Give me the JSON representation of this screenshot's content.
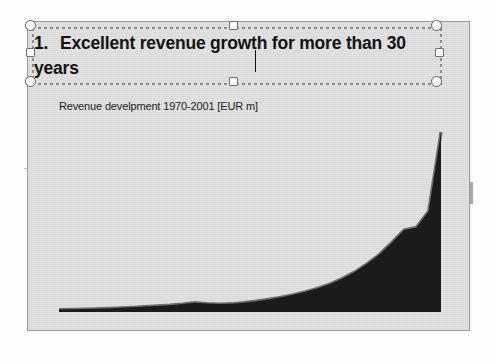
{
  "app": {
    "name": "presentation-slide-editor",
    "background_color": "#fdfdfd",
    "slide_background_color": "#d9d9d9",
    "slide_border_color": "#9a9a9a"
  },
  "slide": {
    "title": {
      "number": "1.",
      "text": "Excellent revenue growth for more than 30 years",
      "line1": "Excellent revenue growth for more than",
      "line2": "30 years",
      "selected": true,
      "caret_visible": true
    },
    "subtitle": "Revenue develpment 1970-2001 [EUR m]"
  },
  "selection_handles": [
    {
      "name": "handle-top-left",
      "shape": "circle",
      "x": 0,
      "y": 0
    },
    {
      "name": "handle-top-center",
      "shape": "square",
      "x": 203,
      "y": 0
    },
    {
      "name": "handle-top-right",
      "shape": "circle",
      "x": 406,
      "y": 0
    },
    {
      "name": "handle-middle-left",
      "shape": "square",
      "x": 0,
      "y": 26
    },
    {
      "name": "handle-middle-right",
      "shape": "square",
      "x": 406,
      "y": 26
    },
    {
      "name": "handle-bottom-left",
      "shape": "circle",
      "x": 0,
      "y": 52
    },
    {
      "name": "handle-bottom-center",
      "shape": "square",
      "x": 203,
      "y": 52
    },
    {
      "name": "handle-bottom-right",
      "shape": "circle",
      "x": 406,
      "y": 52
    }
  ],
  "chart_data": {
    "type": "area",
    "title": "Revenue develpment 1970-2001 [EUR m]",
    "xlabel": "",
    "ylabel": "",
    "grid": false,
    "legend": false,
    "axis_visible": false,
    "fill_color": "#1b1b1b",
    "edge_color": "#6e6e6e",
    "xlim": [
      1970,
      2001
    ],
    "ylim": [
      0,
      1000
    ],
    "x": [
      1970,
      1971,
      1972,
      1973,
      1974,
      1975,
      1976,
      1977,
      1978,
      1979,
      1980,
      1981,
      1982,
      1983,
      1984,
      1985,
      1986,
      1987,
      1988,
      1989,
      1990,
      1991,
      1992,
      1993,
      1994,
      1995,
      1996,
      1997,
      1998,
      1999,
      2000,
      2001
    ],
    "values": [
      14,
      15,
      16,
      18,
      20,
      23,
      26,
      30,
      34,
      38,
      44,
      52,
      47,
      44,
      46,
      52,
      60,
      70,
      82,
      96,
      112,
      132,
      156,
      186,
      222,
      268,
      320,
      385,
      455,
      470,
      560,
      1000
    ],
    "categories": [
      "1970",
      "1971",
      "1972",
      "1973",
      "1974",
      "1975",
      "1976",
      "1977",
      "1978",
      "1979",
      "1980",
      "1981",
      "1982",
      "1983",
      "1984",
      "1985",
      "1986",
      "1987",
      "1988",
      "1989",
      "1990",
      "1991",
      "1992",
      "1993",
      "1994",
      "1995",
      "1996",
      "1997",
      "1998",
      "1999",
      "2000",
      "2001"
    ],
    "series": [
      {
        "name": "Revenue",
        "values": [
          14,
          15,
          16,
          18,
          20,
          23,
          26,
          30,
          34,
          38,
          44,
          52,
          47,
          44,
          46,
          52,
          60,
          70,
          82,
          96,
          112,
          132,
          156,
          186,
          222,
          268,
          320,
          385,
          455,
          470,
          560,
          1000
        ]
      }
    ]
  }
}
